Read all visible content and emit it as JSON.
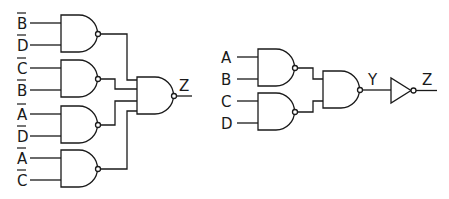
{
  "diagram": {
    "title": "",
    "left_circuit": {
      "gates": [
        {
          "type": "NAND",
          "inputs": [
            {
              "label": "B",
              "inverted": true
            },
            {
              "label": "D",
              "inverted": true
            }
          ]
        },
        {
          "type": "NAND",
          "inputs": [
            {
              "label": "C",
              "inverted": true
            },
            {
              "label": "B",
              "inverted": true
            }
          ]
        },
        {
          "type": "NAND",
          "inputs": [
            {
              "label": "A",
              "inverted": true
            },
            {
              "label": "D",
              "inverted": true
            }
          ]
        },
        {
          "type": "NAND",
          "inputs": [
            {
              "label": "A",
              "inverted": true
            },
            {
              "label": "C",
              "inverted": true
            }
          ]
        }
      ],
      "output_gate": {
        "type": "NAND",
        "input_count": 4
      },
      "output_label": "Z"
    },
    "right_circuit": {
      "gates": [
        {
          "type": "NAND",
          "inputs": [
            {
              "label": "A",
              "inverted": false
            },
            {
              "label": "B",
              "inverted": false
            }
          ]
        },
        {
          "type": "NAND",
          "inputs": [
            {
              "label": "C",
              "inverted": false
            },
            {
              "label": "D",
              "inverted": false
            }
          ]
        }
      ],
      "second_stage": {
        "type": "NAND",
        "input_count": 2
      },
      "intermediate_label": "Y",
      "inverter": {
        "type": "NOT"
      },
      "output_label": "Z"
    }
  }
}
